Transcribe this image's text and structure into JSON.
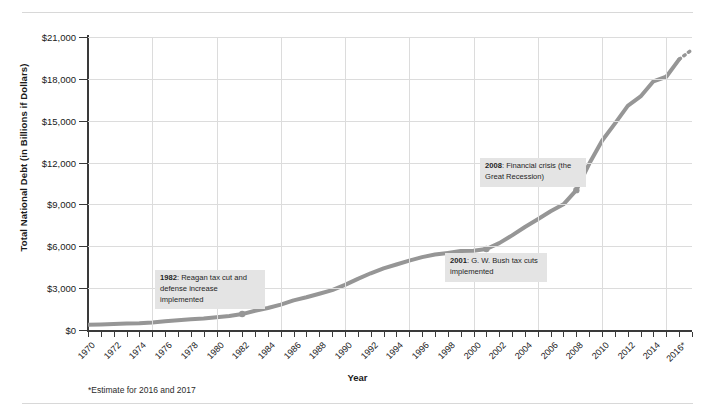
{
  "axes": {
    "y_title": "Total National Debt (in Billions if Dollars)",
    "x_title": "Year",
    "y_ticks": [
      "$21,000",
      "$18,000",
      "$15,000",
      "$12,000",
      "$9,000",
      "$6,000",
      "$3,000",
      "$0"
    ],
    "x_ticks": [
      "1970",
      "1972",
      "1974",
      "1976",
      "1978",
      "1980",
      "1982",
      "1984",
      "1986",
      "1988",
      "1990",
      "1992",
      "1994",
      "1996",
      "1998",
      "2000",
      "2002",
      "2004",
      "2006",
      "2008",
      "2010",
      "2012",
      "2014",
      "2016*"
    ]
  },
  "footnote": "*Estimate for 2016 and 2017",
  "annotations": [
    {
      "id": "a1982",
      "year": "1982",
      "text": ": Reagan tax cut and defense increase implemented"
    },
    {
      "id": "a2001",
      "year": "2001",
      "text": ": G. W. Bush tax cuts implemented"
    },
    {
      "id": "a2008",
      "year": "2008",
      "text": ": Financial crisis (the Great Recession)"
    }
  ],
  "colors": {
    "line": "#969696",
    "grid": "#dcdcdc",
    "axis": "#3a3a3a",
    "annotation_bg": "#e4e4e4"
  },
  "chart_data": {
    "type": "line",
    "title": "",
    "xlabel": "Year",
    "ylabel": "Total National Debt (in Billions if Dollars)",
    "xlim": [
      1970,
      2017
    ],
    "ylim": [
      0,
      21000
    ],
    "ytick_step": 3000,
    "grid": true,
    "legend": null,
    "x": [
      1970,
      1971,
      1972,
      1973,
      1974,
      1975,
      1976,
      1977,
      1978,
      1979,
      1980,
      1981,
      1982,
      1983,
      1984,
      1985,
      1986,
      1987,
      1988,
      1989,
      1990,
      1991,
      1992,
      1993,
      1994,
      1995,
      1996,
      1997,
      1998,
      1999,
      2000,
      2001,
      2002,
      2003,
      2004,
      2005,
      2006,
      2007,
      2008,
      2009,
      2010,
      2011,
      2012,
      2013,
      2014,
      2015,
      2016,
      2017
    ],
    "values": [
      371,
      398,
      427,
      458,
      475,
      533,
      620,
      699,
      772,
      827,
      908,
      998,
      1142,
      1377,
      1573,
      1823,
      2125,
      2350,
      2602,
      2857,
      3233,
      3665,
      4065,
      4411,
      4693,
      4974,
      5225,
      5413,
      5526,
      5656,
      5674,
      5807,
      6228,
      6783,
      7379,
      7933,
      8507,
      9008,
      10025,
      11910,
      13562,
      14790,
      16066,
      16738,
      17824,
      18151,
      19400,
      20100
    ],
    "markers": [
      {
        "year": 1982,
        "value": 1142
      },
      {
        "year": 2001,
        "value": 5807
      },
      {
        "year": 2008,
        "value": 10025
      }
    ],
    "dashed_tail_from": 2016,
    "annotations": [
      {
        "year": 1982,
        "label": "1982: Reagan tax cut and defense increase implemented"
      },
      {
        "year": 2001,
        "label": "2001: G. W. Bush tax cuts implemented"
      },
      {
        "year": 2008,
        "label": "2008: Financial crisis (the Great Recession)"
      }
    ]
  }
}
